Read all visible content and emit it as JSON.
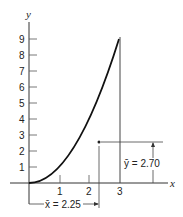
{
  "diagram": {
    "axes": {
      "x_label": "x",
      "y_label": "y",
      "x_ticks": [
        "1",
        "2",
        "3"
      ],
      "y_ticks": [
        "1",
        "2",
        "3",
        "4",
        "5",
        "6",
        "7",
        "8",
        "9"
      ]
    },
    "curve": {
      "description": "y = x^2 from x=0 to x=3",
      "end_value": 9
    },
    "centroid": {
      "x_bar_label": "x̄ = 2.25",
      "y_bar_label": "ȳ = 2.70",
      "x_bar": 2.25,
      "y_bar": 2.7
    }
  }
}
